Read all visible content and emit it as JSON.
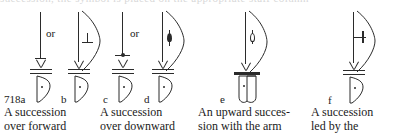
{
  "page": {
    "kind": "labanotation-figure-plate",
    "top_cut_text": "succession, the symbol  is placed  on  the  appropriate  staff  column",
    "background_color": "#ffffff",
    "ink_color": "#2b2b2b"
  },
  "plate_number": "718",
  "connectors": {
    "or_1": "or",
    "or_2": "or"
  },
  "figures": [
    {
      "id": "a",
      "label": "718a",
      "glyph": "perpendicular-on-stem",
      "has_arc": false,
      "staff_bar": "double",
      "base": "triangle-with-dot",
      "inner_symbol": "perpendicular"
    },
    {
      "id": "b",
      "label": "b",
      "glyph": "perpendicular-in-arc",
      "has_arc": true,
      "staff_bar": "double",
      "base": "triangle-with-dot",
      "inner_symbol": "perpendicular"
    },
    {
      "id": "c",
      "label": "c",
      "glyph": "t-bar-with-dot",
      "has_arc": false,
      "staff_bar": "double",
      "base": "triangle-with-dot",
      "inner_symbol": "horizontal-bar-with-dot"
    },
    {
      "id": "d",
      "label": "d",
      "glyph": "stem-with-filled-blob-in-arc",
      "has_arc": true,
      "staff_bar": "double",
      "base": "triangle-with-dot",
      "inner_symbol": "filled-lens"
    },
    {
      "id": "e",
      "label": "e",
      "glyph": "stem-with-hollow-blob-in-arc",
      "has_arc": true,
      "staff_bar": "single-thick",
      "base": "prism-with-dot",
      "inner_symbol": "hollow-lens"
    },
    {
      "id": "f",
      "label": "f",
      "glyph": "hook-bar-in-arc",
      "has_arc": true,
      "staff_bar": "double",
      "base": "triangle-with-dot",
      "inner_symbol": "bar-with-vertical-stroke"
    }
  ],
  "captions": [
    {
      "key": "cap1",
      "line1": "A succession",
      "line2": "over forward"
    },
    {
      "key": "cap2",
      "line1": "A succession",
      "line2": "over downward"
    },
    {
      "key": "cap3",
      "line1": "An upward succes-",
      "line2": "sion with the arm"
    },
    {
      "key": "cap4",
      "line1": "A succession",
      "line2": "led by the"
    }
  ]
}
